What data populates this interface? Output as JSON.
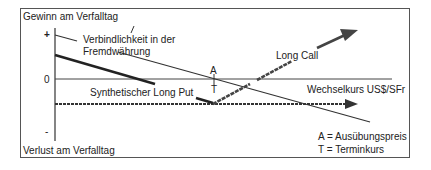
{
  "diagram": {
    "y_axis_top_label": "Gewinn am Verfalltag",
    "y_axis_bottom_label": "Verlust am Verfalltag",
    "y_tick_plus": "+",
    "y_tick_zero": "0",
    "y_tick_minus": "-",
    "x_axis_label": "Wechselkurs US$/SFr",
    "line_labels": {
      "liability": "Verbindlichkeit in der Fremdwährung",
      "liability_line1": "Verbindlichkeit in der",
      "liability_line2": "Fremdwährung",
      "long_call": "Long Call",
      "synthetic_put": "Synthetischer Long Put"
    },
    "marker_a": "A",
    "marker_t": "T",
    "legend": {
      "a": "A = Ausübungspreis",
      "t": "T = Terminkurs"
    }
  }
}
